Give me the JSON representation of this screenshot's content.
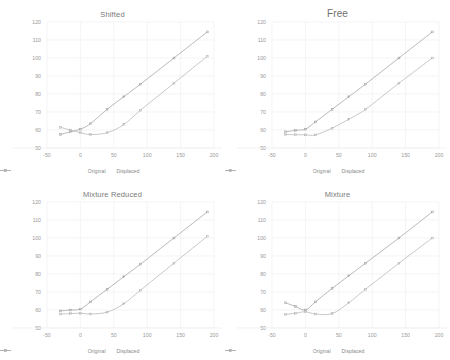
{
  "figure": {
    "panel_count": 4,
    "background": "#ffffff",
    "series_colors": {
      "original": "#9b9b9b",
      "displaced": "#b0b0b0"
    },
    "grid_color": "#ededed",
    "text_color": "#9a9a9a"
  },
  "legend": {
    "original_label": "Original",
    "displaced_label": "Displaced",
    "original_marker": "line-marker-icon",
    "displaced_marker": "line-marker-icon"
  },
  "panels": [
    {
      "id": "shifted",
      "title": "Shifted",
      "title_size": "small"
    },
    {
      "id": "free",
      "title": "Free",
      "title_size": "large"
    },
    {
      "id": "mixture-reduced",
      "title": "Mixture Reduced",
      "title_size": "small"
    },
    {
      "id": "mixture",
      "title": "Mixture",
      "title_size": "small"
    }
  ],
  "chart_data": [
    {
      "type": "line",
      "title": "Shifted",
      "xlabel": "",
      "ylabel": "",
      "xlim": [
        -50,
        200
      ],
      "ylim": [
        50,
        120
      ],
      "xticks": [
        -50,
        0,
        50,
        100,
        150,
        200
      ],
      "yticks": [
        50,
        60,
        70,
        80,
        90,
        100,
        110,
        120
      ],
      "grid": true,
      "legend_position": "bottom",
      "series": [
        {
          "name": "Original",
          "x": [
            -30,
            -15,
            0,
            15,
            40,
            65,
            90,
            140,
            190
          ],
          "y": [
            57.5,
            59.0,
            60.5,
            63.5,
            71.5,
            78.5,
            85.5,
            100.0,
            114.5
          ]
        },
        {
          "name": "Displaced",
          "x": [
            -30,
            -15,
            0,
            15,
            40,
            65,
            90,
            140,
            190
          ],
          "y": [
            61.5,
            60.0,
            58.5,
            57.5,
            58.5,
            63.0,
            71.0,
            86.0,
            101.0
          ]
        }
      ]
    },
    {
      "type": "line",
      "title": "Free",
      "xlabel": "",
      "ylabel": "",
      "xlim": [
        -50,
        200
      ],
      "ylim": [
        50,
        120
      ],
      "xticks": [
        -50,
        0,
        50,
        100,
        150,
        200
      ],
      "yticks": [
        50,
        60,
        70,
        80,
        90,
        100,
        110,
        120
      ],
      "grid": true,
      "legend_position": "bottom",
      "series": [
        {
          "name": "Original",
          "x": [
            -30,
            -15,
            0,
            15,
            40,
            65,
            90,
            140,
            190
          ],
          "y": [
            59.0,
            59.8,
            60.5,
            64.5,
            71.5,
            78.5,
            85.5,
            100.0,
            114.5
          ]
        },
        {
          "name": "Displaced",
          "x": [
            -30,
            -15,
            0,
            15,
            40,
            65,
            90,
            140,
            190
          ],
          "y": [
            57.5,
            57.4,
            57.3,
            57.3,
            61.0,
            66.0,
            71.5,
            86.0,
            100.0
          ]
        }
      ]
    },
    {
      "type": "line",
      "title": "Mixture Reduced",
      "xlabel": "",
      "ylabel": "",
      "xlim": [
        -50,
        200
      ],
      "ylim": [
        50,
        120
      ],
      "xticks": [
        -50,
        0,
        50,
        100,
        150,
        200
      ],
      "yticks": [
        50,
        60,
        70,
        80,
        90,
        100,
        110,
        120
      ],
      "grid": true,
      "legend_position": "bottom",
      "series": [
        {
          "name": "Original",
          "x": [
            -30,
            -15,
            0,
            15,
            40,
            65,
            90,
            140,
            190
          ],
          "y": [
            59.5,
            60.0,
            60.5,
            64.5,
            71.5,
            78.5,
            85.5,
            100.0,
            114.5
          ]
        },
        {
          "name": "Displaced",
          "x": [
            -30,
            -15,
            0,
            15,
            40,
            65,
            90,
            140,
            190
          ],
          "y": [
            57.8,
            58.0,
            58.2,
            57.8,
            58.8,
            63.5,
            71.0,
            86.0,
            101.0
          ]
        }
      ]
    },
    {
      "type": "line",
      "title": "Mixture",
      "xlabel": "",
      "ylabel": "",
      "xlim": [
        -50,
        200
      ],
      "ylim": [
        50,
        120
      ],
      "xticks": [
        -50,
        0,
        50,
        100,
        150,
        200
      ],
      "yticks": [
        50,
        60,
        70,
        80,
        90,
        100,
        110,
        120
      ],
      "grid": true,
      "legend_position": "bottom",
      "series": [
        {
          "name": "Original",
          "x": [
            -30,
            -15,
            0,
            15,
            40,
            65,
            90,
            140,
            190
          ],
          "y": [
            64.0,
            62.0,
            60.0,
            64.5,
            72.0,
            79.0,
            86.0,
            100.0,
            114.5
          ]
        },
        {
          "name": "Displaced",
          "x": [
            -30,
            -15,
            0,
            15,
            40,
            65,
            90,
            140,
            190
          ],
          "y": [
            57.5,
            58.2,
            59.0,
            57.8,
            58.0,
            64.0,
            71.5,
            86.0,
            100.0
          ]
        }
      ]
    }
  ]
}
